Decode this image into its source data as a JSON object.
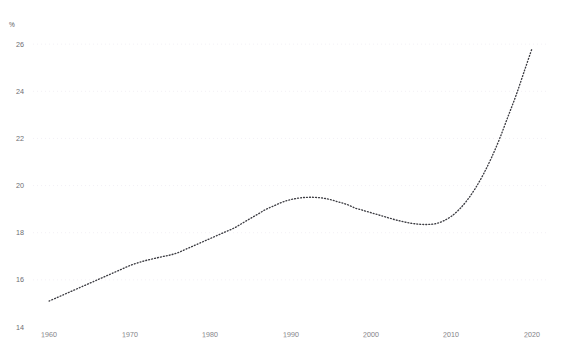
{
  "chart_data": {
    "type": "line",
    "title": "",
    "subtitle": "",
    "xlabel": "",
    "ylabel": "%",
    "unit_label": "%",
    "xlim": [
      1958,
      2022
    ],
    "ylim": [
      14,
      26.6
    ],
    "xticks": [
      1960,
      1970,
      1980,
      1990,
      2000,
      2010,
      2020
    ],
    "xtick_labels": [
      "1960",
      "1970",
      "1980",
      "1990",
      "2000",
      "2010",
      "2020"
    ],
    "yticks": [
      14,
      16,
      18,
      20,
      22,
      24,
      26
    ],
    "ytick_labels": [
      "14",
      "16",
      "18",
      "20",
      "22",
      "24",
      "26"
    ],
    "grid": "horizontal-faint",
    "legend": null,
    "line_style": "dotted",
    "line_color": "#3c3c42",
    "series": [
      {
        "name": "share",
        "x": [
          1960,
          1961,
          1962,
          1963,
          1964,
          1965,
          1966,
          1967,
          1968,
          1969,
          1970,
          1971,
          1972,
          1973,
          1974,
          1975,
          1976,
          1977,
          1978,
          1979,
          1980,
          1981,
          1982,
          1983,
          1984,
          1985,
          1986,
          1987,
          1988,
          1989,
          1990,
          1991,
          1992,
          1993,
          1994,
          1995,
          1996,
          1997,
          1998,
          1999,
          2000,
          2001,
          2002,
          2003,
          2004,
          2005,
          2006,
          2007,
          2008,
          2009,
          2010,
          2011,
          2012,
          2013,
          2014,
          2015,
          2016,
          2017,
          2018,
          2019,
          2020
        ],
        "values": [
          15.1,
          15.25,
          15.4,
          15.55,
          15.7,
          15.85,
          16.0,
          16.15,
          16.3,
          16.45,
          16.6,
          16.72,
          16.82,
          16.9,
          16.98,
          17.05,
          17.15,
          17.3,
          17.45,
          17.6,
          17.75,
          17.9,
          18.05,
          18.2,
          18.4,
          18.6,
          18.8,
          19.0,
          19.15,
          19.3,
          19.4,
          19.47,
          19.5,
          19.5,
          19.47,
          19.4,
          19.3,
          19.2,
          19.05,
          18.95,
          18.85,
          18.75,
          18.65,
          18.55,
          18.47,
          18.4,
          18.36,
          18.35,
          18.38,
          18.5,
          18.7,
          19.0,
          19.4,
          19.9,
          20.5,
          21.2,
          22.0,
          22.9,
          23.8,
          24.8,
          25.8
        ]
      }
    ]
  },
  "axis": {
    "unit": "%"
  }
}
